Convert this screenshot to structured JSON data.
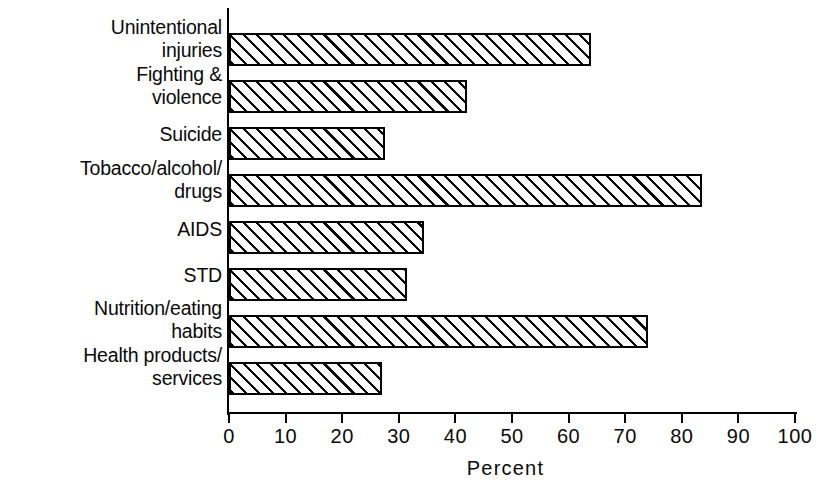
{
  "chart_data": {
    "type": "bar",
    "orientation": "horizontal",
    "title": "",
    "subtitle": "",
    "xlabel": "Percent",
    "ylabel": "",
    "xlim": [
      0,
      100
    ],
    "ylim": null,
    "grid": false,
    "legend": null,
    "xticks": [
      "0",
      "10",
      "20",
      "30",
      "40",
      "50",
      "60",
      "70",
      "80",
      "90",
      "100"
    ],
    "xtick_values": [
      0,
      10,
      20,
      30,
      40,
      50,
      60,
      70,
      80,
      90,
      100
    ],
    "categories": [
      "Unintentional\ninjuries",
      "Fighting &\nviolence",
      "Suicide",
      "Tobacco/alcohol/\ndrugs",
      "AIDS",
      "STD",
      "Nutrition/eating\nhabits",
      "Health products/\nservices"
    ],
    "values": [
      64,
      42,
      27.5,
      83.5,
      34.5,
      31.5,
      74,
      27
    ],
    "bar_style": {
      "fill": "diagonal-hatch",
      "hatch_color": "#000000",
      "background_color": "#ffffff",
      "edge_color": "#000000"
    }
  },
  "axis": {
    "x_title": "Percent"
  }
}
